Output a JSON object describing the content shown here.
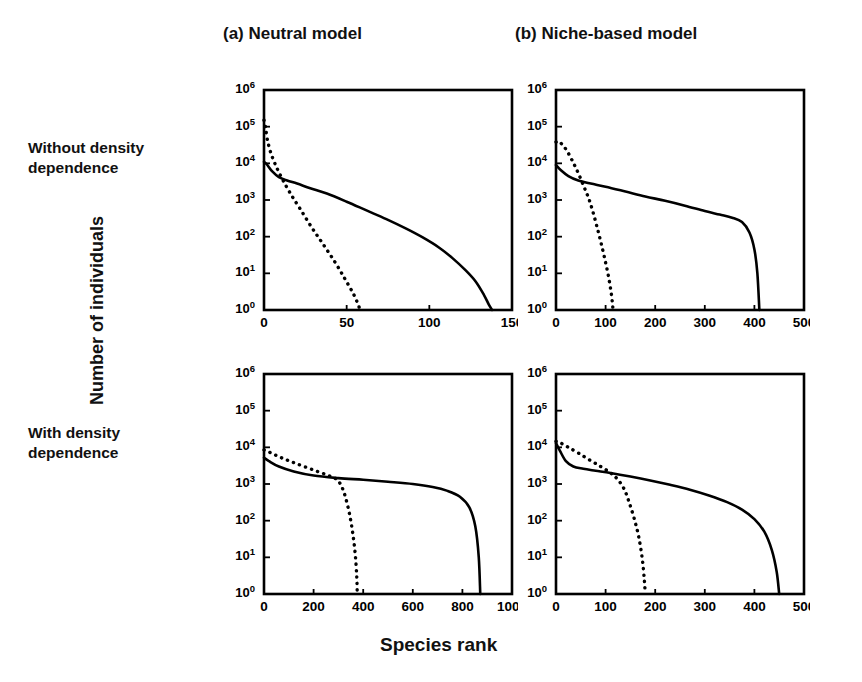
{
  "figure": {
    "y_axis_title": "Number of individuals",
    "x_axis_title": "Species rank",
    "column_headers": [
      {
        "id": "a",
        "label": "(a) Neutral model"
      },
      {
        "id": "b",
        "label": "(b) Niche-based model"
      }
    ],
    "row_labels": [
      {
        "id": "without",
        "label": "Without density\ndependence"
      },
      {
        "id": "with",
        "label": "With density\ndependence"
      }
    ]
  },
  "chart_data": [
    {
      "id": "panel-a",
      "type": "line",
      "title": "(a) Neutral model — Without density dependence",
      "xlabel": "Species rank",
      "ylabel": "Number of individuals",
      "yscale": "log",
      "ylim": [
        1,
        1000000
      ],
      "ytick_labels": [
        "10^0",
        "10^1",
        "10^2",
        "10^3",
        "10^4",
        "10^5",
        "10^6"
      ],
      "ytick_values": [
        1,
        10,
        100,
        1000,
        10000,
        100000,
        1000000
      ],
      "xlim": [
        0,
        150
      ],
      "xtick_labels": [
        "0",
        "50",
        "100",
        "150"
      ],
      "xtick_values": [
        0,
        50,
        100,
        150
      ],
      "grid": false,
      "legend": "none",
      "series": [
        {
          "name": "solid-curve",
          "style": "solid",
          "x": [
            0,
            2,
            5,
            9,
            14,
            20,
            28,
            38,
            50,
            62,
            74,
            86,
            96,
            106,
            114,
            122,
            128,
            133,
            136,
            138
          ],
          "y": [
            11000,
            9000,
            6000,
            4200,
            3400,
            2800,
            2100,
            1500,
            900,
            520,
            300,
            165,
            95,
            50,
            26,
            12,
            6,
            2.6,
            1.4,
            1
          ]
        },
        {
          "name": "dotted-curve",
          "style": "dotted",
          "x": [
            0,
            1,
            2,
            4,
            7,
            11,
            16,
            22,
            29,
            36,
            43,
            49,
            54,
            57,
            58
          ],
          "y": [
            150000,
            90000,
            45000,
            20000,
            9000,
            3800,
            1500,
            560,
            175,
            60,
            20,
            7,
            2.8,
            1.4,
            1
          ]
        }
      ]
    },
    {
      "id": "panel-b",
      "type": "line",
      "title": "(b) Niche-based model — Without density dependence",
      "xlabel": "Species rank",
      "ylabel": "Number of individuals",
      "yscale": "log",
      "ylim": [
        1,
        1000000
      ],
      "ytick_labels": [
        "10^0",
        "10^1",
        "10^2",
        "10^3",
        "10^4",
        "10^5",
        "10^6"
      ],
      "ytick_values": [
        1,
        10,
        100,
        1000,
        10000,
        100000,
        1000000
      ],
      "xlim": [
        0,
        500
      ],
      "xtick_labels": [
        "0",
        "100",
        "200",
        "300",
        "400",
        "500"
      ],
      "xtick_values": [
        0,
        100,
        200,
        300,
        400,
        500
      ],
      "grid": false,
      "legend": "none",
      "series": [
        {
          "name": "solid-curve",
          "style": "solid",
          "x": [
            0,
            10,
            25,
            45,
            70,
            100,
            140,
            180,
            220,
            260,
            300,
            330,
            355,
            375,
            390,
            400,
            406,
            410
          ],
          "y": [
            9000,
            6500,
            4500,
            3400,
            2800,
            2300,
            1700,
            1250,
            950,
            700,
            500,
            400,
            330,
            250,
            130,
            45,
            10,
            1
          ]
        },
        {
          "name": "dotted-curve",
          "style": "dotted",
          "x": [
            0,
            5,
            12,
            22,
            34,
            46,
            57,
            66,
            74,
            82,
            90,
            98,
            106,
            112,
            115
          ],
          "y": [
            38000,
            40000,
            33000,
            22000,
            11000,
            5000,
            2200,
            1100,
            500,
            200,
            75,
            26,
            8,
            2.5,
            1
          ]
        }
      ]
    },
    {
      "id": "panel-c",
      "type": "line",
      "title": "(a) Neutral model — With density dependence",
      "xlabel": "Species rank",
      "ylabel": "Number of individuals",
      "yscale": "log",
      "ylim": [
        1,
        1000000
      ],
      "ytick_labels": [
        "10^0",
        "10^1",
        "10^2",
        "10^3",
        "10^4",
        "10^5",
        "10^6"
      ],
      "ytick_values": [
        1,
        10,
        100,
        1000,
        10000,
        100000,
        1000000
      ],
      "xlim": [
        0,
        1000
      ],
      "xtick_labels": [
        "0",
        "200",
        "400",
        "600",
        "800",
        "1000"
      ],
      "xtick_values": [
        0,
        200,
        400,
        600,
        800,
        1000
      ],
      "grid": false,
      "legend": "none",
      "series": [
        {
          "name": "solid-curve",
          "style": "solid",
          "x": [
            0,
            20,
            60,
            120,
            200,
            300,
            400,
            500,
            600,
            680,
            740,
            790,
            828,
            852,
            866,
            872
          ],
          "y": [
            5200,
            4200,
            3000,
            2200,
            1700,
            1450,
            1300,
            1150,
            1000,
            830,
            650,
            450,
            230,
            70,
            10,
            1
          ]
        },
        {
          "name": "dotted-curve",
          "style": "dotted",
          "x": [
            0,
            25,
            70,
            130,
            200,
            260,
            295,
            315,
            330,
            345,
            358,
            368,
            374,
            376
          ],
          "y": [
            8500,
            7200,
            5200,
            3600,
            2400,
            1700,
            1300,
            800,
            400,
            150,
            45,
            12,
            3,
            1
          ]
        }
      ]
    },
    {
      "id": "panel-d",
      "type": "line",
      "title": "(b) Niche-based model — With density dependence",
      "xlabel": "Species rank",
      "ylabel": "Number of individuals",
      "yscale": "log",
      "ylim": [
        1,
        1000000
      ],
      "ytick_labels": [
        "10^0",
        "10^1",
        "10^2",
        "10^3",
        "10^4",
        "10^5",
        "10^6"
      ],
      "ytick_values": [
        1,
        10,
        100,
        1000,
        10000,
        100000,
        1000000
      ],
      "xlim": [
        0,
        500
      ],
      "xtick_labels": [
        "0",
        "100",
        "200",
        "300",
        "400",
        "500"
      ],
      "xtick_values": [
        0,
        100,
        200,
        300,
        400,
        500
      ],
      "grid": false,
      "legend": "none",
      "series": [
        {
          "name": "solid-curve",
          "style": "solid",
          "x": [
            0,
            8,
            20,
            35,
            55,
            80,
            110,
            150,
            190,
            230,
            270,
            310,
            345,
            375,
            400,
            420,
            435,
            445,
            450
          ],
          "y": [
            13000,
            8000,
            4200,
            3000,
            2600,
            2300,
            2000,
            1600,
            1250,
            950,
            700,
            480,
            320,
            200,
            110,
            50,
            16,
            4,
            1
          ]
        },
        {
          "name": "dotted-curve",
          "style": "dotted",
          "x": [
            0,
            10,
            25,
            45,
            68,
            90,
            110,
            125,
            138,
            148,
            158,
            167,
            174,
            178,
            180
          ],
          "y": [
            14500,
            13000,
            10000,
            7000,
            4500,
            3000,
            2000,
            1300,
            700,
            300,
            110,
            35,
            9,
            2.5,
            1
          ]
        }
      ]
    }
  ]
}
